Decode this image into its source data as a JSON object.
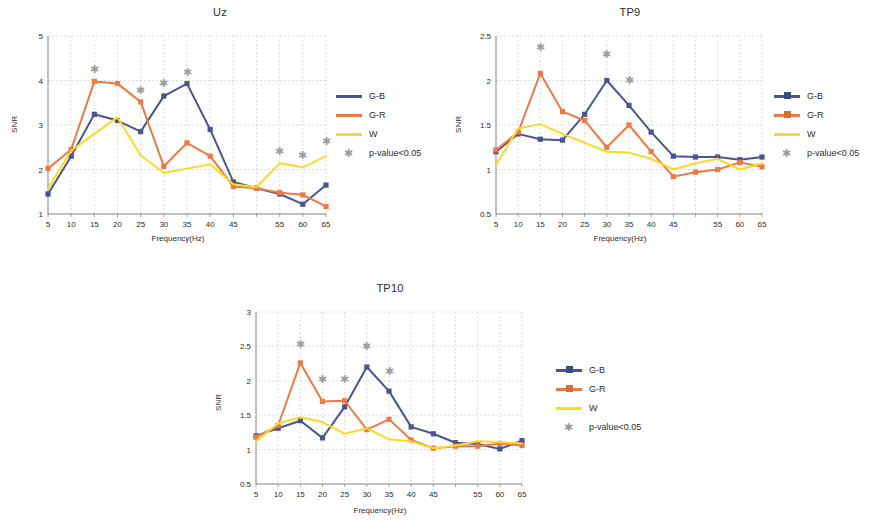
{
  "figure": {
    "series_colors": {
      "G-B": "#4a5590",
      "G-R": "#ec7a45",
      "W": "#fbd928",
      "asterisk": "#9d9d9d",
      "grid": "#c8c8c8",
      "axis": "#808080"
    },
    "legend_entries": [
      {
        "label": "G-B",
        "icon": "line-square-marker"
      },
      {
        "label": "G-R",
        "icon": "line-square-marker"
      },
      {
        "label": "W",
        "icon": "line-plain"
      },
      {
        "label": "p-value<0.05",
        "icon": "asterisk-icon"
      }
    ]
  },
  "chart_data": [
    {
      "type": "line",
      "title": "Uz",
      "xlabel": "Frequency(Hz)",
      "ylabel": "SNR",
      "x": [
        5,
        10,
        15,
        20,
        25,
        30,
        35,
        40,
        45,
        50,
        55,
        60,
        65
      ],
      "xticklabels": [
        "5",
        "10",
        "15",
        "20",
        "25",
        "30",
        "35",
        "40",
        "45",
        "",
        "55",
        "60",
        "65"
      ],
      "yticks": [
        1,
        2,
        3,
        4,
        5
      ],
      "ylim": [
        1,
        5
      ],
      "grid": true,
      "legend_position": "right",
      "series": [
        {
          "name": "G-B",
          "color": "#4a5590",
          "marker": "square",
          "values": [
            1.45,
            2.3,
            3.24,
            3.1,
            2.85,
            3.65,
            3.93,
            2.9,
            1.72,
            1.58,
            1.45,
            1.22,
            1.65
          ]
        },
        {
          "name": "G-R",
          "color": "#ec7a45",
          "marker": "square",
          "values": [
            2.02,
            2.45,
            3.98,
            3.93,
            3.52,
            2.07,
            2.6,
            2.3,
            1.62,
            1.58,
            1.48,
            1.43,
            1.17
          ]
        },
        {
          "name": "W",
          "color": "#fbd928",
          "marker": "none",
          "values": [
            1.58,
            2.42,
            2.8,
            3.17,
            2.32,
            1.92,
            2.02,
            2.12,
            1.67,
            1.6,
            2.14,
            2.05,
            2.3
          ]
        }
      ],
      "significance_markers": [
        {
          "x": 15,
          "y": 4.25
        },
        {
          "x": 25,
          "y": 3.78
        },
        {
          "x": 30,
          "y": 3.95
        },
        {
          "x": 35,
          "y": 4.2
        },
        {
          "x": 55,
          "y": 2.42
        },
        {
          "x": 60,
          "y": 2.32
        },
        {
          "x": 65,
          "y": 2.65
        }
      ]
    },
    {
      "type": "line",
      "title": "TP9",
      "xlabel": "Frequency(Hz)",
      "ylabel": "SNR",
      "x": [
        5,
        10,
        15,
        20,
        25,
        30,
        35,
        40,
        45,
        50,
        55,
        60,
        65
      ],
      "xticklabels": [
        "5",
        "10",
        "15",
        "20",
        "25",
        "30",
        "35",
        "40",
        "45",
        "",
        "55",
        "60",
        "65"
      ],
      "yticks": [
        0.5,
        1,
        1.5,
        2,
        2.5
      ],
      "ylim": [
        0.5,
        2.5
      ],
      "grid": true,
      "legend_position": "right",
      "series": [
        {
          "name": "G-B",
          "color": "#4a5590",
          "marker": "square",
          "values": [
            1.2,
            1.4,
            1.34,
            1.33,
            1.62,
            2.0,
            1.72,
            1.42,
            1.15,
            1.14,
            1.14,
            1.11,
            1.14
          ]
        },
        {
          "name": "G-R",
          "color": "#ec7a45",
          "marker": "square",
          "values": [
            1.22,
            1.42,
            2.08,
            1.65,
            1.55,
            1.25,
            1.5,
            1.2,
            0.92,
            0.97,
            1.0,
            1.08,
            1.03
          ]
        },
        {
          "name": "W",
          "color": "#fbd928",
          "marker": "none",
          "values": [
            1.05,
            1.46,
            1.51,
            1.4,
            1.3,
            1.2,
            1.19,
            1.12,
            1.0,
            1.07,
            1.12,
            1.0,
            1.07
          ]
        }
      ],
      "significance_markers": [
        {
          "x": 15,
          "y": 2.38
        },
        {
          "x": 30,
          "y": 2.3
        },
        {
          "x": 35,
          "y": 2.01
        }
      ]
    },
    {
      "type": "line",
      "title": "TP10",
      "xlabel": "Frequency(Hz)",
      "ylabel": "SNR",
      "x": [
        5,
        10,
        15,
        20,
        25,
        30,
        35,
        40,
        45,
        50,
        55,
        60,
        65
      ],
      "xticklabels": [
        "5",
        "10",
        "15",
        "20",
        "25",
        "30",
        "35",
        "40",
        "45",
        "",
        "55",
        "60",
        "65"
      ],
      "yticks": [
        0.5,
        1,
        1.5,
        2,
        2.5,
        3
      ],
      "ylim": [
        0.5,
        3
      ],
      "grid": true,
      "legend_position": "right",
      "series": [
        {
          "name": "G-B",
          "color": "#4a5590",
          "marker": "square",
          "values": [
            1.2,
            1.31,
            1.42,
            1.17,
            1.62,
            2.2,
            1.85,
            1.33,
            1.23,
            1.1,
            1.08,
            1.01,
            1.13
          ]
        },
        {
          "name": "G-R",
          "color": "#ec7a45",
          "marker": "square",
          "values": [
            1.18,
            1.35,
            2.26,
            1.7,
            1.71,
            1.29,
            1.44,
            1.14,
            1.02,
            1.05,
            1.05,
            1.09,
            1.06
          ]
        },
        {
          "name": "W",
          "color": "#fbd928",
          "marker": "none",
          "values": [
            1.12,
            1.38,
            1.47,
            1.4,
            1.23,
            1.31,
            1.15,
            1.12,
            1.02,
            1.06,
            1.12,
            1.11,
            1.09
          ]
        }
      ],
      "significance_markers": [
        {
          "x": 15,
          "y": 2.53
        },
        {
          "x": 20,
          "y": 2.02
        },
        {
          "x": 25,
          "y": 2.02
        },
        {
          "x": 30,
          "y": 2.5
        },
        {
          "x": 35,
          "y": 2.14
        }
      ]
    }
  ]
}
